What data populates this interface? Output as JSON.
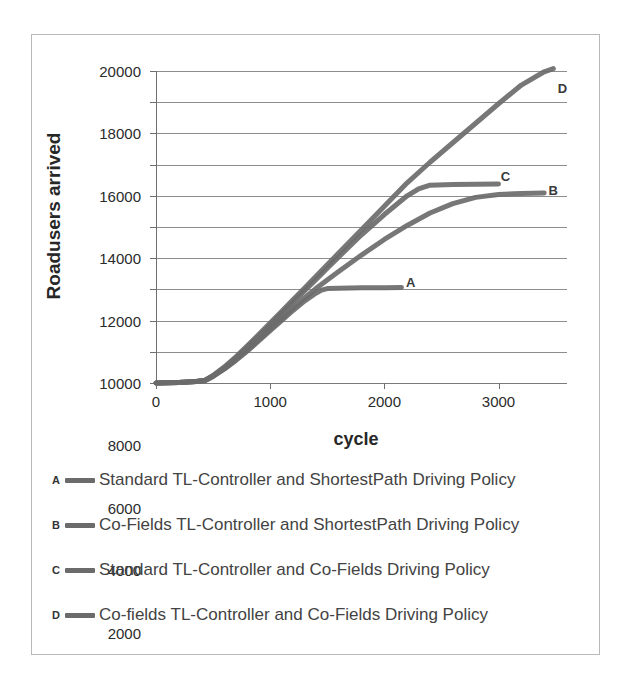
{
  "chart_data": {
    "type": "line",
    "title": "",
    "xlabel": "cycle",
    "ylabel": "Roadusers arrived",
    "xlim": [
      0,
      3600
    ],
    "ylim": [
      0,
      20000
    ],
    "xticks": [
      "0",
      "1000",
      "2000",
      "3000"
    ],
    "xtick_values": [
      0,
      1000,
      2000,
      3000
    ],
    "yticks": [
      "0",
      "2000",
      "4000",
      "6000",
      "8000",
      "10000",
      "12000",
      "14000",
      "16000",
      "18000",
      "20000"
    ],
    "ytick_values": [
      0,
      2000,
      4000,
      6000,
      8000,
      10000,
      12000,
      14000,
      16000,
      18000,
      20000
    ],
    "grid": true,
    "legend_position": "below",
    "series_color": "#6b6b6b",
    "series": [
      {
        "key": "A",
        "name": "Standard TL-Controller and ShortestPath Driving Policy",
        "end_label": "A",
        "x": [
          0,
          200,
          350,
          430,
          500,
          600,
          700,
          800,
          900,
          1000,
          1100,
          1200,
          1300,
          1400,
          1450,
          1500,
          1600,
          1800,
          2000,
          2150
        ],
        "y": [
          0,
          40,
          90,
          160,
          420,
          900,
          1450,
          2050,
          2700,
          3350,
          4000,
          4650,
          5250,
          5750,
          5950,
          6050,
          6080,
          6100,
          6110,
          6120
        ]
      },
      {
        "key": "B",
        "name": "Co-Fields TL-Controller and ShortestPath Driving Policy",
        "end_label": "B",
        "x": [
          0,
          200,
          350,
          430,
          500,
          600,
          700,
          800,
          900,
          1000,
          1100,
          1200,
          1300,
          1400,
          1500,
          1600,
          1800,
          2000,
          2200,
          2400,
          2600,
          2800,
          3000,
          3200,
          3400
        ],
        "y": [
          0,
          40,
          90,
          160,
          430,
          930,
          1500,
          2120,
          2780,
          3450,
          4120,
          4800,
          5450,
          6050,
          6600,
          7150,
          8200,
          9200,
          10100,
          10900,
          11500,
          11900,
          12080,
          12150,
          12180
        ]
      },
      {
        "key": "C",
        "name": "Standard TL-Controller and Co-Fields Driving Policy",
        "end_label": "C",
        "x": [
          0,
          200,
          350,
          430,
          500,
          600,
          700,
          800,
          900,
          1000,
          1100,
          1200,
          1300,
          1400,
          1500,
          1600,
          1800,
          2000,
          2200,
          2300,
          2400,
          2600,
          2800,
          3000
        ],
        "y": [
          0,
          40,
          90,
          170,
          460,
          1000,
          1620,
          2300,
          3000,
          3720,
          4450,
          5180,
          5900,
          6620,
          7350,
          8080,
          9500,
          10800,
          12000,
          12450,
          12680,
          12720,
          12740,
          12750
        ]
      },
      {
        "key": "D",
        "name": "Co-fields TL-Controller and Co-Fields Driving Policy",
        "end_label": "D",
        "x": [
          0,
          200,
          350,
          430,
          500,
          600,
          700,
          800,
          900,
          1000,
          1100,
          1200,
          1300,
          1400,
          1500,
          1600,
          1800,
          2000,
          2200,
          2400,
          2600,
          2800,
          3000,
          3200,
          3400,
          3480
        ],
        "y": [
          0,
          40,
          90,
          175,
          480,
          1040,
          1680,
          2380,
          3100,
          3840,
          4580,
          5330,
          6080,
          6830,
          7580,
          8330,
          9830,
          11330,
          12830,
          14150,
          15400,
          16650,
          17900,
          19100,
          19950,
          20150
        ]
      }
    ],
    "annotations": [
      {
        "text": "A",
        "x": 2230,
        "y": 6450
      },
      {
        "text": "B",
        "x": 3480,
        "y": 12400
      },
      {
        "text": "C",
        "x": 3060,
        "y": 13300
      },
      {
        "text": "D",
        "x": 3560,
        "y": 18900
      }
    ]
  },
  "legend": {
    "entries": [
      {
        "key": "A",
        "label": "Standard TL-Controller and ShortestPath Driving Policy"
      },
      {
        "key": "B",
        "label": "Co-Fields TL-Controller and ShortestPath Driving Policy"
      },
      {
        "key": "C",
        "label": "Standard TL-Controller and Co-Fields Driving Policy"
      },
      {
        "key": "D",
        "label": "Co-fields TL-Controller and Co-Fields Driving Policy"
      }
    ]
  }
}
